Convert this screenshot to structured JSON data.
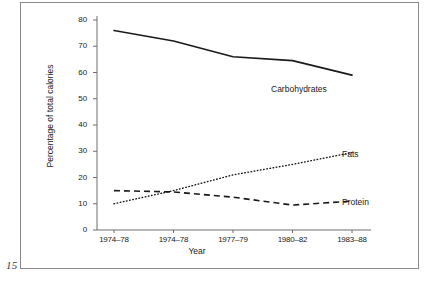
{
  "page": {
    "folio": "15"
  },
  "chart_data": {
    "type": "line",
    "title": "",
    "xlabel": "Year",
    "ylabel": "Percentage of total calories",
    "categories": [
      "1974–78",
      "1974–78",
      "1977–79",
      "1980–82",
      "1983–88"
    ],
    "ylim": [
      0,
      80
    ],
    "yticks": [
      0,
      10,
      20,
      30,
      40,
      50,
      60,
      70,
      80
    ],
    "ytick_labels": [
      "0",
      "10",
      "20",
      "30",
      "40",
      "50",
      "60",
      "70",
      "80"
    ],
    "grid": false,
    "legend_position": "inline-right-of-line-ends",
    "series": [
      {
        "name": "Carbohydrates",
        "label": "Carbohydrates",
        "style": "solid",
        "color": "#1a1a1a",
        "values": [
          76,
          72,
          66,
          64.5,
          59
        ]
      },
      {
        "name": "Fats",
        "label": "Fats",
        "style": "dotted",
        "color": "#1a1a1a",
        "values": [
          10,
          15,
          21,
          25,
          29.5
        ]
      },
      {
        "name": "Protein",
        "label": "Protein",
        "style": "dashed",
        "color": "#1a1a1a",
        "values": [
          15,
          14.5,
          12.5,
          9.5,
          11
        ]
      }
    ]
  }
}
